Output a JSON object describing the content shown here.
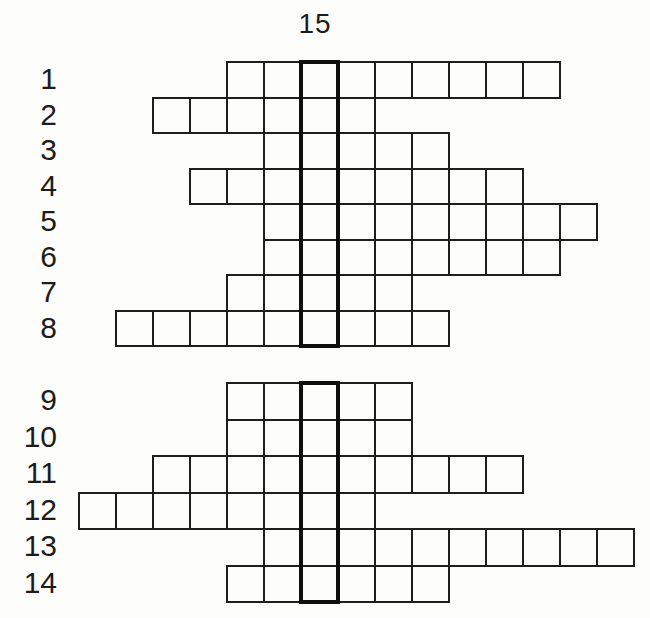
{
  "title_label": "15",
  "puzzle": {
    "description": "word puzzle grid with numbered answer rows crossing a highlighted vertical column",
    "highlighted_column_label": "15",
    "rows": [
      {
        "label": "1",
        "block": "top",
        "cells_left_of_column": 2,
        "cells_right_of_column": 6,
        "total_cells": 9
      },
      {
        "label": "2",
        "block": "top",
        "cells_left_of_column": 4,
        "cells_right_of_column": 1,
        "total_cells": 6
      },
      {
        "label": "3",
        "block": "top",
        "cells_left_of_column": 1,
        "cells_right_of_column": 3,
        "total_cells": 5
      },
      {
        "label": "4",
        "block": "top",
        "cells_left_of_column": 3,
        "cells_right_of_column": 5,
        "total_cells": 9
      },
      {
        "label": "5",
        "block": "top",
        "cells_left_of_column": 1,
        "cells_right_of_column": 7,
        "total_cells": 9
      },
      {
        "label": "6",
        "block": "top",
        "cells_left_of_column": 1,
        "cells_right_of_column": 6,
        "total_cells": 8
      },
      {
        "label": "7",
        "block": "top",
        "cells_left_of_column": 2,
        "cells_right_of_column": 2,
        "total_cells": 5
      },
      {
        "label": "8",
        "block": "top",
        "cells_left_of_column": 5,
        "cells_right_of_column": 3,
        "total_cells": 9
      },
      {
        "label": "9",
        "block": "bottom",
        "cells_left_of_column": 2,
        "cells_right_of_column": 2,
        "total_cells": 5
      },
      {
        "label": "10",
        "block": "bottom",
        "cells_left_of_column": 2,
        "cells_right_of_column": 2,
        "total_cells": 5
      },
      {
        "label": "11",
        "block": "bottom",
        "cells_left_of_column": 4,
        "cells_right_of_column": 5,
        "total_cells": 10
      },
      {
        "label": "12",
        "block": "bottom",
        "cells_left_of_column": 6,
        "cells_right_of_column": 1,
        "total_cells": 8
      },
      {
        "label": "13",
        "block": "bottom",
        "cells_left_of_column": 1,
        "cells_right_of_column": 8,
        "total_cells": 10
      },
      {
        "label": "14",
        "block": "bottom",
        "cells_left_of_column": 2,
        "cells_right_of_column": 3,
        "total_cells": 6
      }
    ],
    "all_cells_empty": true
  },
  "colors": {
    "background": "#fdfdfb",
    "grid_line": "#1e1e1e",
    "bold_column_line": "#0e0e0e",
    "text": "#1c1c1c"
  }
}
